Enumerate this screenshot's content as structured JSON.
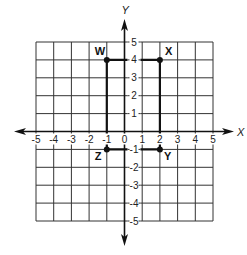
{
  "chart_data": {
    "type": "scatter",
    "title": "",
    "xlabel": "X",
    "ylabel": "Y",
    "xlim": [
      -5,
      5
    ],
    "ylim": [
      -5,
      5
    ],
    "grid": true,
    "x_ticks": [
      -5,
      -4,
      -3,
      -2,
      -1,
      0,
      1,
      2,
      3,
      4,
      5
    ],
    "y_ticks": [
      -5,
      -4,
      -3,
      -2,
      -1,
      1,
      2,
      3,
      4,
      5
    ],
    "points": [
      {
        "label": "W",
        "x": -1,
        "y": 4
      },
      {
        "label": "X",
        "x": 2,
        "y": 4
      },
      {
        "label": "Y",
        "x": 2,
        "y": -1
      },
      {
        "label": "Z",
        "x": -1,
        "y": -1
      }
    ],
    "shape": {
      "type": "rectangle",
      "vertices": [
        "W",
        "X",
        "Y",
        "Z"
      ]
    }
  },
  "colors": {
    "grid": "#333333",
    "axis": "#111111",
    "shape": "#111111",
    "background": "#ffffff"
  }
}
